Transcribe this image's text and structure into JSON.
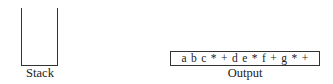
{
  "stack": {
    "label": "Stack",
    "items": []
  },
  "output": {
    "label": "Output",
    "value": "a b c * + d e * f + g * +"
  }
}
